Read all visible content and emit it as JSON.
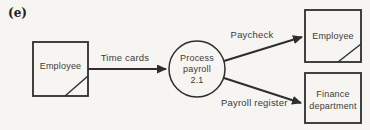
{
  "figure_label": "(e)",
  "diagram": {
    "type": "data-flow-diagram",
    "external_entities": [
      {
        "id": "employee-source",
        "label": "Employee"
      },
      {
        "id": "employee-destination",
        "label": "Employee"
      },
      {
        "id": "finance-department",
        "label": "Finance department"
      }
    ],
    "process": {
      "number": "2.1",
      "lines": [
        "Process",
        "payroll",
        "2.1"
      ]
    },
    "flows": [
      {
        "label": "Time cards",
        "from": "Employee",
        "to": "Process payroll 2.1"
      },
      {
        "label": "Paycheck",
        "from": "Process payroll 2.1",
        "to": "Employee"
      },
      {
        "label": "Payroll register",
        "from": "Process payroll 2.1",
        "to": "Finance department"
      }
    ],
    "colors": {
      "background": "#f6f5f1",
      "line": "#2e2e2e",
      "text": "#3b3b3b"
    }
  }
}
